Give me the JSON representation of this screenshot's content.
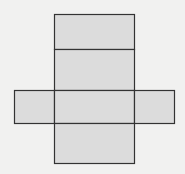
{
  "diagram": {
    "title": "",
    "colors": {
      "background": "#f1f1f0",
      "face_fill": "#dcdcdc",
      "stroke": "#333333"
    },
    "faces": [
      {
        "id": "top",
        "x": 54,
        "y": 14,
        "w": 80,
        "h": 35
      },
      {
        "id": "back",
        "x": 54,
        "y": 49,
        "w": 80,
        "h": 41
      },
      {
        "id": "left",
        "x": 14,
        "y": 90,
        "w": 40,
        "h": 33
      },
      {
        "id": "bottom",
        "x": 54,
        "y": 90,
        "w": 80,
        "h": 33
      },
      {
        "id": "right",
        "x": 134,
        "y": 90,
        "w": 40,
        "h": 33
      },
      {
        "id": "front",
        "x": 54,
        "y": 123,
        "w": 80,
        "h": 40
      }
    ]
  }
}
